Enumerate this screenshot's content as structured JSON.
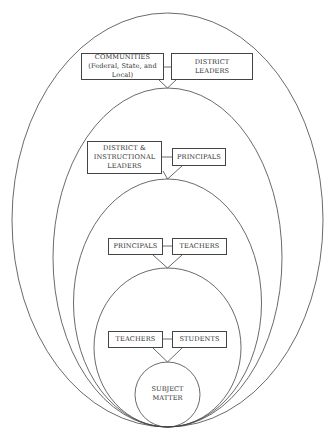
{
  "diagram": {
    "type": "nested-ellipses",
    "stroke_color": "#444444",
    "background": "#ffffff",
    "levels": [
      {
        "id": "level-1",
        "left_label": "COMMUNITIES\n(Federal, State, and Local)",
        "right_label": "DISTRICT\nLEADERS"
      },
      {
        "id": "level-2",
        "left_label": "DISTRICT &\nINSTRUCTIONAL\nLEADERS",
        "right_label": "PRINCIPALS"
      },
      {
        "id": "level-3",
        "left_label": "PRINCIPALS",
        "right_label": "TEACHERS"
      },
      {
        "id": "level-4",
        "left_label": "TEACHERS",
        "right_label": "STUDENTS"
      }
    ],
    "core": {
      "label": "SUBJECT\nMATTER"
    }
  }
}
